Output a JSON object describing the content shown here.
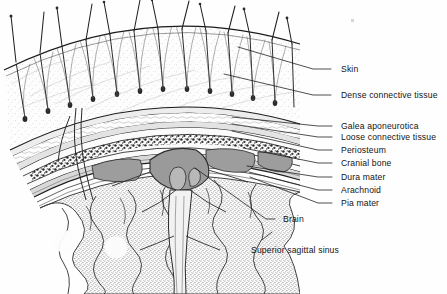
{
  "figure": {
    "background_color": "#fefefe",
    "ink_color": "#1c1c1c",
    "label_color": "#141414"
  },
  "labels": [
    {
      "id": "skin",
      "text": "Skin",
      "text_x": 341,
      "text_y": 72,
      "leader": [
        [
          331,
          69
        ],
        [
          313,
          69
        ],
        [
          238,
          47
        ]
      ]
    },
    {
      "id": "dense",
      "text": "Dense connective tissue",
      "text_x": 341,
      "text_y": 98,
      "leader": [
        [
          331,
          95
        ],
        [
          313,
          95
        ],
        [
          224,
          74
        ]
      ]
    },
    {
      "id": "galea",
      "text": "Galea aponeurotica",
      "text_x": 341,
      "text_y": 129,
      "leader": [
        [
          332,
          126
        ],
        [
          318,
          126
        ],
        [
          232,
          117
        ]
      ]
    },
    {
      "id": "loose",
      "text": "Loose connective tissue",
      "text_x": 341,
      "text_y": 140,
      "leader": [
        [
          332,
          137
        ],
        [
          318,
          137
        ],
        [
          232,
          124
        ]
      ]
    },
    {
      "id": "periosteum",
      "text": "Periosteum",
      "text_x": 341,
      "text_y": 153,
      "leader": [
        [
          332,
          150
        ],
        [
          318,
          150
        ],
        [
          232,
          131
        ]
      ]
    },
    {
      "id": "cranial-bone",
      "text": "Cranial bone",
      "text_x": 341,
      "text_y": 166,
      "leader": [
        [
          332,
          163
        ],
        [
          318,
          163
        ],
        [
          243,
          148
        ]
      ]
    },
    {
      "id": "dura",
      "text": "Dura mater",
      "text_x": 341,
      "text_y": 180,
      "leader": [
        [
          332,
          177
        ],
        [
          318,
          177
        ],
        [
          247,
          166
        ]
      ]
    },
    {
      "id": "arachnoid",
      "text": "Arachnoid",
      "text_x": 341,
      "text_y": 193,
      "leader": [
        [
          332,
          190
        ],
        [
          318,
          190
        ],
        [
          249,
          172
        ]
      ]
    },
    {
      "id": "pia",
      "text": "Pia mater",
      "text_x": 341,
      "text_y": 206,
      "leader": [
        [
          332,
          203
        ],
        [
          318,
          203
        ],
        [
          250,
          177
        ]
      ]
    },
    {
      "id": "brain",
      "text": "Brain",
      "text_x": 283,
      "text_y": 222,
      "leader": [
        [
          275,
          219
        ],
        [
          266,
          219
        ],
        [
          195,
          168
        ]
      ]
    },
    {
      "id": "sagittal-sinus",
      "text": "Superior sagittal sinus",
      "text_x": 251,
      "text_y": 253,
      "leader": [
        [
          262,
          240
        ],
        [
          272,
          232
        ]
      ]
    }
  ],
  "artifact": {
    "id": "scan-speck",
    "x": 352,
    "y": 20
  }
}
